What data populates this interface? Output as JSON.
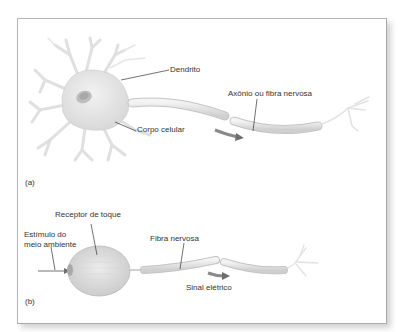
{
  "figure": {
    "panel_a": {
      "letter": "(a)",
      "labels": {
        "dendrite": "Dendrito",
        "axon": "Axônio ou fibra nervosa",
        "cell_body": "Corpo celular"
      }
    },
    "panel_b": {
      "letter": "(b)",
      "labels": {
        "touch_receptor": "Receptor de toque",
        "stimulus_line1": "Estímulo do",
        "stimulus_line2": "meio ambiente",
        "nerve_fiber": "Fibra nervosa",
        "electric_signal": "Sinal elétrico"
      }
    },
    "colors": {
      "tissue": "#e6e6e6",
      "tissue_stroke": "#c8c8c8",
      "nucleus": "#b8b8b8",
      "arrow": "#6e6e6e",
      "leader_line": "#333333",
      "frame_border": "#b0b0b0"
    }
  }
}
